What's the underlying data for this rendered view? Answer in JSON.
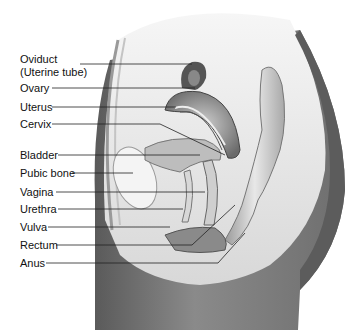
{
  "figure": {
    "labels": [
      {
        "id": "oviduct",
        "text": "Oviduct",
        "y": 53
      },
      {
        "id": "oviduct-sub",
        "text": "(Uterine tube)",
        "y": 66
      },
      {
        "id": "ovary",
        "text": "Ovary",
        "y": 82
      },
      {
        "id": "uterus",
        "text": "Uterus",
        "y": 101
      },
      {
        "id": "cervix",
        "text": "Cervix",
        "y": 118
      },
      {
        "id": "bladder",
        "text": "Bladder",
        "y": 149
      },
      {
        "id": "pubic-bone",
        "text": "Pubic bone",
        "y": 167
      },
      {
        "id": "vagina",
        "text": "Vagina",
        "y": 186
      },
      {
        "id": "urethra",
        "text": "Urethra",
        "y": 203
      },
      {
        "id": "vulva",
        "text": "Vulva",
        "y": 221
      },
      {
        "id": "rectum",
        "text": "Rectum",
        "y": 239
      },
      {
        "id": "anus",
        "text": "Anus",
        "y": 257
      }
    ]
  }
}
